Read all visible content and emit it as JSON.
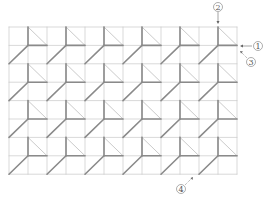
{
  "diagram": {
    "grid": {
      "x": 9,
      "y": 27,
      "cols": 12,
      "rows": 8,
      "cell_w": 19,
      "cell_h": 18.4
    },
    "colors": {
      "grid": "#c8c8c8",
      "thick": "#8a8a8a",
      "thin": "#bdbdbd",
      "label": "#555555"
    },
    "markers": [
      {
        "id": "1",
        "text": "1",
        "cx": 258,
        "cy": 46
      },
      {
        "id": "2",
        "text": "2",
        "cx": 218,
        "cy": 7
      },
      {
        "id": "3",
        "text": "3",
        "cx": 251,
        "cy": 62
      },
      {
        "id": "4",
        "text": "4",
        "cx": 181,
        "cy": 189
      }
    ]
  }
}
